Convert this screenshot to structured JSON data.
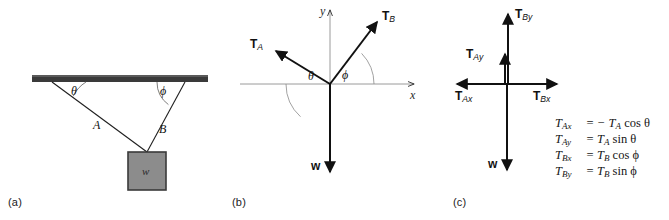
{
  "figure": {
    "background_color": "#ffffff"
  },
  "colors": {
    "ink": "#111111",
    "axis_gray": "#9a9a9a",
    "bar_dark": "#3a3a3a",
    "block_fill": "#8c8c8c",
    "block_stroke": "#3a3a3a",
    "arc_gray": "#6f6f6f"
  },
  "panel_a": {
    "label": "(a)",
    "ceiling_bar_name": "ceiling-bar",
    "string_a_label": "A",
    "string_b_label": "B",
    "angle_theta": "θ",
    "angle_phi": "ϕ",
    "weight_label": "w"
  },
  "panel_b": {
    "label": "(b)",
    "x_axis_label": "x",
    "y_axis_label": "y",
    "tension_a": "T",
    "tension_a_sub": "A",
    "tension_b": "T",
    "tension_b_sub": "B",
    "weight_label": "w",
    "angle_theta": "θ",
    "angle_phi": "ϕ"
  },
  "panel_c": {
    "label": "(c)",
    "t_ax": "T",
    "t_ax_sub": "Ax",
    "t_ay": "T",
    "t_ay_sub": "Ay",
    "t_bx": "T",
    "t_bx_sub": "Bx",
    "t_by": "T",
    "t_by_sub": "By",
    "weight_label": "w",
    "equations": [
      {
        "lhs": "T",
        "lhs_sub": "Ax",
        "eq": "=",
        "rhs_pre": "− T",
        "rhs_sub": "A",
        "fn": "cos",
        "arg": "θ"
      },
      {
        "lhs": "T",
        "lhs_sub": "Ay",
        "eq": "=",
        "rhs_pre": "T",
        "rhs_sub": "A",
        "fn": "sin",
        "arg": "θ"
      },
      {
        "lhs": "T",
        "lhs_sub": "Bx",
        "eq": "=",
        "rhs_pre": "T",
        "rhs_sub": "B",
        "fn": "cos",
        "arg": "ϕ"
      },
      {
        "lhs": "T",
        "lhs_sub": "By",
        "eq": "=",
        "rhs_pre": "T",
        "rhs_sub": "B",
        "fn": "sin",
        "arg": "ϕ"
      }
    ]
  }
}
